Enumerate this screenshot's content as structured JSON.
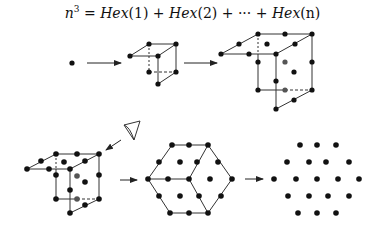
{
  "title": {
    "base": "n",
    "exponent": "3",
    "eq": " = ",
    "term1": "Hex",
    "arg1": "(1)",
    "plus1": " + ",
    "term2": "Hex",
    "arg2": "(2)",
    "plus2": " + ··· + ",
    "term3": "Hex",
    "arg3": "(n)"
  },
  "colors": {
    "dot": "#111111",
    "hidden_dot": "#555555",
    "line": "#333333",
    "background": "#ffffff"
  },
  "stages": [
    {
      "name": "single-point",
      "n": 1
    },
    {
      "name": "cube-2",
      "n": 2
    },
    {
      "name": "cube-3",
      "n": 3
    },
    {
      "name": "cube-3-viewed",
      "n": 3
    },
    {
      "name": "hexagon-projection"
    },
    {
      "name": "centered-hexagonal-number-dots"
    }
  ]
}
